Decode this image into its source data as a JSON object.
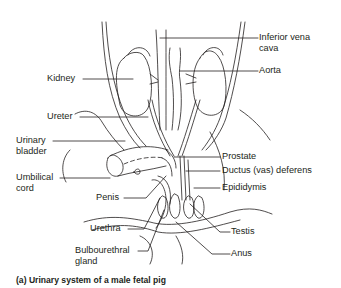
{
  "figure": {
    "caption": "(a) Urinary system of a male fetal pig",
    "labels": {
      "inferior_vena_cava_1": "Inferior vena",
      "inferior_vena_cava_2": "cava",
      "aorta": "Aorta",
      "kidney": "Kidney",
      "ureter": "Ureter",
      "urinary_bladder_1": "Urinary",
      "urinary_bladder_2": "bladder",
      "umbilical_cord_1": "Umbilical",
      "umbilical_cord_2": "cord",
      "penis": "Penis",
      "prostate": "Prostate",
      "ductus_deferens": "Ductus (vas) deferens",
      "epididymis": "Epididymis",
      "urethra": "Urethra",
      "testis": "Testis",
      "bulbourethral_gland_1": "Bulbourethral",
      "bulbourethral_gland_2": "gland",
      "anus": "Anus"
    },
    "line_color": "#231f20"
  }
}
